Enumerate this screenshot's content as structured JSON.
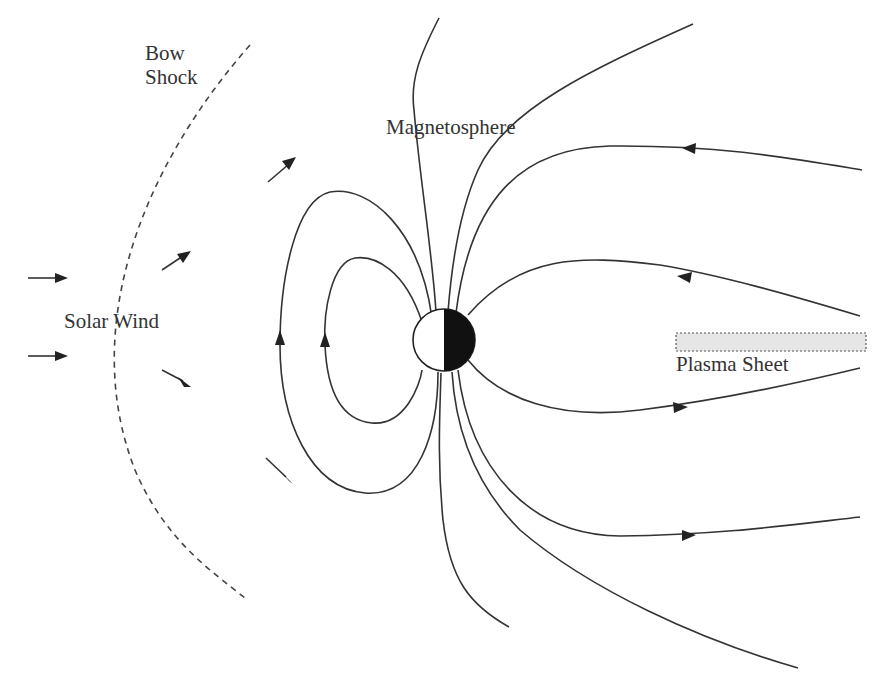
{
  "diagram": {
    "labels": {
      "bow_shock_line1": "Bow",
      "bow_shock_line2": "Shock",
      "magnetosphere": "Magnetosphere",
      "solar_wind": "Solar Wind",
      "plasma_sheet": "Plasma Sheet"
    },
    "colors": {
      "line": "#333333",
      "earth_night": "#111111",
      "earth_day": "#ffffff",
      "plasma_sheet_fill": "#e6e6e6",
      "plasma_sheet_border": "#555555"
    },
    "elements": [
      "bow-shock",
      "solar-wind-arrows",
      "deflected-flow-arrows",
      "closed-dipole-field-lines",
      "open-field-lines",
      "earth",
      "plasma-sheet"
    ]
  }
}
